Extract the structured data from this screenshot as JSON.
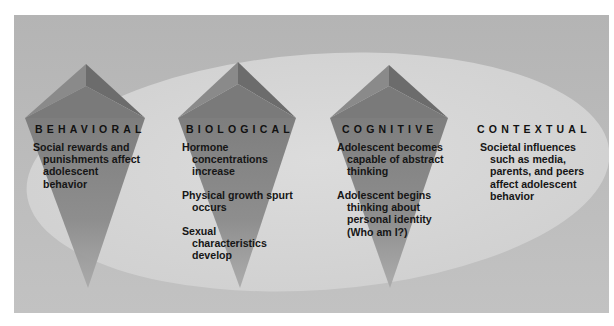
{
  "diagram": {
    "type": "influences-on-adolescent-development",
    "colors": {
      "panel": "#b9b9b9",
      "ellipse": "#d6d6d6",
      "pyramid_dark": "#6a6a6a",
      "pyramid_mid": "#888888",
      "pyramid_light": "#9a9a9a",
      "text": "#111111"
    },
    "columns": [
      {
        "header": "BEHAVIORAL",
        "items": [
          {
            "first": "Social rewards and",
            "rest": [
              "punishments affect",
              "adolescent",
              "behavior"
            ]
          }
        ]
      },
      {
        "header": "BIOLOGICAL",
        "items": [
          {
            "first": "Hormone",
            "rest": [
              "concentrations",
              "increase"
            ]
          },
          {
            "first": "Physical growth spurt",
            "rest": [
              "occurs"
            ]
          },
          {
            "first": "Sexual",
            "rest": [
              "characteristics",
              "develop"
            ]
          }
        ]
      },
      {
        "header": "COGNITIVE",
        "items": [
          {
            "first": "Adolescent becomes",
            "rest": [
              "capable of abstract",
              "thinking"
            ]
          },
          {
            "first": "Adolescent begins",
            "rest": [
              "thinking about",
              "personal identity",
              "(Who am I?)"
            ]
          }
        ]
      },
      {
        "header": "CONTEXTUAL",
        "items": [
          {
            "first": "Societal influences",
            "rest": [
              "such as media,",
              "parents, and peers",
              "affect adolescent",
              "behavior"
            ]
          }
        ]
      }
    ]
  }
}
